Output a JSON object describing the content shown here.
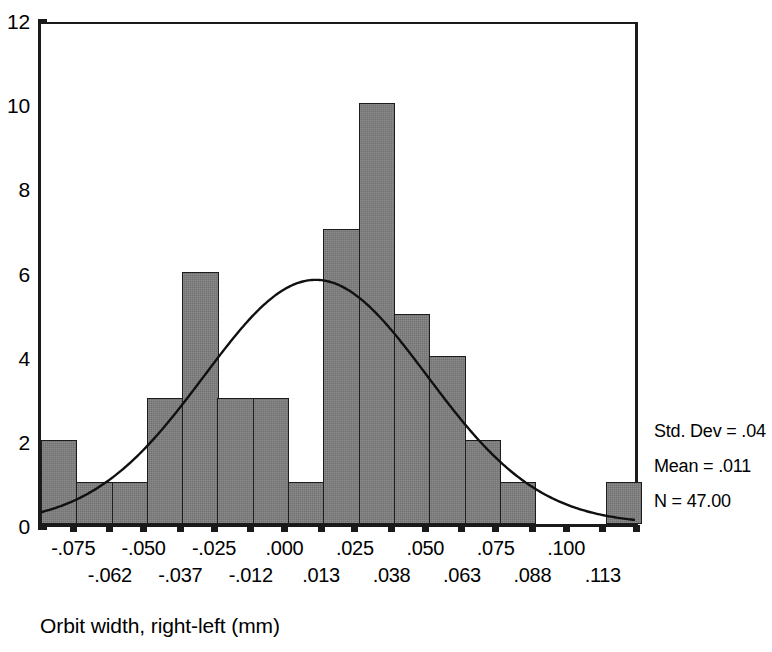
{
  "chart_data": {
    "type": "bar",
    "title": "",
    "subtitle": "",
    "xlabel": "Orbit width, right-left (mm)",
    "ylabel": "",
    "grid": false,
    "legend_position": "none",
    "xlim": [
      -0.0875,
      0.1255
    ],
    "ylim": [
      0,
      12
    ],
    "bin_width": 0.0125,
    "bin_centers": [
      -0.075,
      -0.062,
      -0.05,
      -0.037,
      -0.025,
      -0.012,
      0.0,
      0.013,
      0.025,
      0.038,
      0.05,
      0.063,
      0.075,
      0.088,
      0.1,
      0.113,
      0.125
    ],
    "categories": [
      "-.075",
      "-.062",
      "-.050",
      "-.037",
      "-.025",
      "-.012",
      ".000",
      ".013",
      ".025",
      ".038",
      ".050",
      ".063",
      ".075",
      ".088",
      ".100",
      ".113",
      ".125"
    ],
    "values": [
      2,
      1,
      1,
      3,
      6,
      3,
      3,
      1,
      7,
      10,
      5,
      4,
      2,
      1,
      0,
      0,
      1
    ],
    "series": [
      {
        "name": "Frequency",
        "values": [
          2,
          1,
          1,
          3,
          6,
          3,
          3,
          1,
          7,
          10,
          5,
          4,
          2,
          1,
          0,
          0,
          1
        ]
      }
    ],
    "overlay": {
      "type": "normal-curve",
      "mean": 0.011,
      "std_dev": 0.04,
      "n": 47,
      "peak_value": 5.9
    },
    "y_ticks": [
      "0",
      "2",
      "4",
      "6",
      "8",
      "10",
      "12"
    ],
    "y_tick_values": [
      0,
      2,
      4,
      6,
      8,
      10,
      12
    ],
    "x_ticks_upper": [
      "-.075",
      "-.050",
      "-.025",
      ".000",
      ".025",
      ".050",
      ".075",
      ".100"
    ],
    "x_ticks_upper_values": [
      -0.075,
      -0.05,
      -0.025,
      0.0,
      0.025,
      0.05,
      0.075,
      0.1
    ],
    "x_ticks_lower": [
      "-.062",
      "-.037",
      "-.012",
      ".013",
      ".038",
      ".063",
      ".088",
      ".113"
    ],
    "x_ticks_lower_values": [
      -0.062,
      -0.037,
      -0.012,
      0.013,
      0.038,
      0.063,
      0.088,
      0.113
    ],
    "annotations": [
      "Std. Dev = .04",
      "Mean = .011",
      "N = 47.00"
    ],
    "colors": {
      "bar_fill": "#7d7d7d",
      "bar_border": "#1c1c1c",
      "axis": "#1a1a1a",
      "curve": "#101010",
      "background": "#ffffff"
    }
  },
  "stats": {
    "std_dev": "Std. Dev = .04",
    "mean": "Mean = .011",
    "n": "N = 47.00"
  },
  "axis": {
    "x_title": "Orbit width, right-left (mm)"
  }
}
